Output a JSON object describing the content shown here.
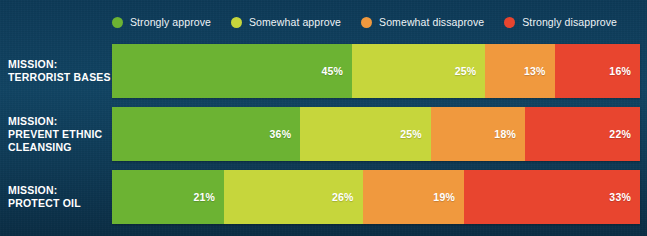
{
  "colors": {
    "background": "#0e3a55",
    "strongly_approve": "#6cb333",
    "somewhat_approve": "#c6d63c",
    "somewhat_disapprove": "#f0993e",
    "strongly_disapprove": "#e8452f",
    "text": "#ffffff"
  },
  "legend": {
    "items": [
      {
        "label": "Strongly approve",
        "color": "#6cb333",
        "icon": "circle-swatch-icon"
      },
      {
        "label": "Somewhat approve",
        "color": "#c6d63c",
        "icon": "circle-swatch-icon"
      },
      {
        "label": "Somewhat dissaprove",
        "color": "#f0993e",
        "icon": "circle-swatch-icon"
      },
      {
        "label": "Strongly disapprove",
        "color": "#e8452f",
        "icon": "circle-swatch-icon"
      }
    ]
  },
  "rows": [
    {
      "label": "MISSION:\nTERRORIST BASES",
      "label_lines": [
        "MISSION:",
        "TERRORIST BASES"
      ],
      "segments": [
        {
          "value": 45,
          "display": "45%",
          "color": "#6cb333"
        },
        {
          "value": 25,
          "display": "25%",
          "color": "#c6d63c"
        },
        {
          "value": 13,
          "display": "13%",
          "color": "#f0993e"
        },
        {
          "value": 16,
          "display": "16%",
          "color": "#e8452f"
        }
      ]
    },
    {
      "label": "MISSION:\nPREVENT ETHNIC CLEANSING",
      "label_lines": [
        "MISSION:",
        "PREVENT ETHNIC",
        "CLEANSING"
      ],
      "segments": [
        {
          "value": 36,
          "display": "36%",
          "color": "#6cb333"
        },
        {
          "value": 25,
          "display": "25%",
          "color": "#c6d63c"
        },
        {
          "value": 18,
          "display": "18%",
          "color": "#f0993e"
        },
        {
          "value": 22,
          "display": "22%",
          "color": "#e8452f"
        }
      ]
    },
    {
      "label": "MISSION:\nPROTECT OIL",
      "label_lines": [
        "MISSION:",
        "PROTECT OIL"
      ],
      "segments": [
        {
          "value": 21,
          "display": "21%",
          "color": "#6cb333"
        },
        {
          "value": 26,
          "display": "26%",
          "color": "#c6d63c"
        },
        {
          "value": 19,
          "display": "19%",
          "color": "#f0993e"
        },
        {
          "value": 33,
          "display": "33%",
          "color": "#e8452f"
        }
      ]
    }
  ],
  "chart_data": {
    "type": "bar",
    "subtype": "stacked-horizontal-100pct",
    "title": "",
    "xlabel": "",
    "ylabel": "",
    "grid": false,
    "legend_position": "top",
    "xlim": [
      0,
      100
    ],
    "categories": [
      "MISSION: TERRORIST BASES",
      "MISSION: PREVENT ETHNIC CLEANSING",
      "MISSION: PROTECT OIL"
    ],
    "series": [
      {
        "name": "Strongly approve",
        "color": "#6cb333",
        "values": [
          45,
          36,
          21
        ]
      },
      {
        "name": "Somewhat approve",
        "color": "#c6d63c",
        "values": [
          25,
          25,
          26
        ]
      },
      {
        "name": "Somewhat dissaprove",
        "color": "#f0993e",
        "values": [
          13,
          18,
          19
        ]
      },
      {
        "name": "Strongly disapprove",
        "color": "#e8452f",
        "values": [
          16,
          22,
          33
        ]
      }
    ]
  }
}
